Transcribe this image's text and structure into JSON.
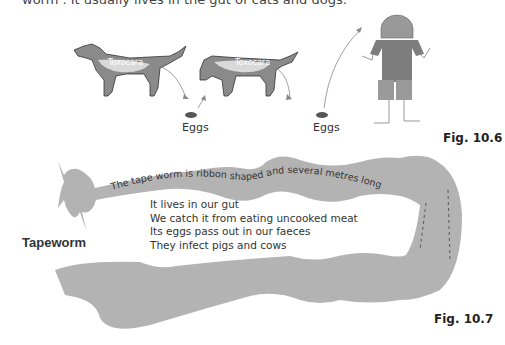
{
  "intro_fragment": "worm . It usually lives in the gut of cats and dogs.",
  "fig_10_6": {
    "label": "Fig. 10.6",
    "dog1_label": "Toxocara",
    "dog2_label": "Toxocara",
    "eggs1": "Eggs",
    "eggs2": "Eggs"
  },
  "fig_10_7": {
    "label": "Fig. 10.7",
    "title": "Tapeworm",
    "curved_caption": "The tape worm is ribbon shaped and several metres long",
    "facts": [
      "It lives in our gut",
      "We catch it from eating uncooked meat",
      "Its eggs pass out in our faeces",
      "They infect pigs and cows"
    ]
  },
  "colors": {
    "worm_fill": "#b3b3b3",
    "dog_fill": "#8a8a8a",
    "person_head": "#999999",
    "person_body": "#7d7d7d",
    "person_shorts": "#9a9a9a"
  }
}
